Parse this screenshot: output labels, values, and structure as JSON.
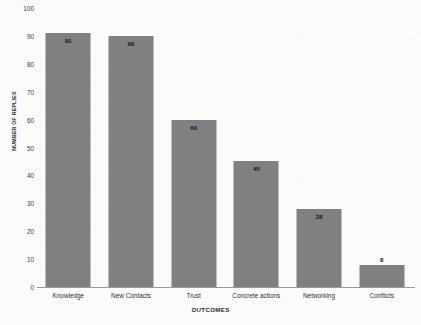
{
  "chart_data": {
    "type": "bar",
    "title": "",
    "xlabel": "OUTCOMES",
    "ylabel": "NUMBER OF REPLIES",
    "categories": [
      "Knowledge",
      "New Contacts",
      "Trust",
      "Concrete actions",
      "Networking",
      "Conflicts"
    ],
    "values": [
      91,
      90,
      60,
      45,
      28,
      8
    ],
    "value_labels": [
      "91",
      "90",
      "60",
      "45",
      "28",
      "8"
    ],
    "label_position": [
      "inside",
      "inside",
      "inside",
      "inside",
      "inside",
      "outside"
    ],
    "ylim": [
      0,
      100
    ],
    "yticks": [
      0,
      10,
      20,
      30,
      40,
      50,
      60,
      70,
      80,
      90,
      100
    ],
    "ytick_labels": [
      "0",
      "10",
      "20",
      "30",
      "40",
      "50",
      "60",
      "70",
      "80",
      "90",
      "100"
    ],
    "grid": false,
    "legend": false,
    "bar_color": "#808080",
    "axis_color": "#9a9a9a",
    "background_color": "#fbfbfa",
    "label_color": "#141414"
  }
}
